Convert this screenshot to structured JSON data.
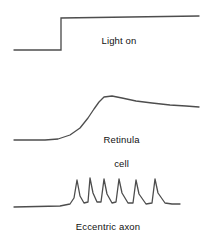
{
  "figure": {
    "background_color": "#ffffff",
    "trace_color": "#4d4d4d",
    "label_color": "#111111",
    "width": 204,
    "height": 242
  },
  "labels": {
    "light_on": "Light on",
    "retinula_line1": "Retinula",
    "retinula_line2": "cell",
    "eccentric_axon": "Eccentric axon"
  },
  "chart_data": {
    "type": "line",
    "xlabel": "",
    "ylabel": "",
    "grid": false,
    "legend": "none",
    "xlim": [
      0,
      204
    ],
    "ylim": [
      242,
      0
    ],
    "annotations": [
      {
        "text": "Light on",
        "x": 135,
        "y": 41
      },
      {
        "text": "Retinula cell",
        "x": 131,
        "y": 134
      },
      {
        "text": "Eccentric axon",
        "x": 133,
        "y": 227
      }
    ],
    "series": [
      {
        "name": "Light on",
        "description": "Square step stimulus marker: flat low baseline, sharp step up at stimulus onset, then sustained high level.",
        "stroke": "#4d4d4d",
        "baseline_y": 50,
        "plateau_y": 18,
        "onset_x": 61,
        "points": [
          [
            14,
            50
          ],
          [
            61,
            50
          ],
          [
            61,
            18
          ],
          [
            199,
            16
          ]
        ]
      },
      {
        "name": "Retinula cell",
        "description": "Graded receptor potential: slow depolarizing sigmoid rise with transient peak overshoot, then slow decay to a sustained plateau.",
        "stroke": "#4d4d4d",
        "baseline_y": 140,
        "peak_y": 97,
        "peak_x": 104,
        "plateau_y": 107,
        "points": [
          [
            14,
            140
          ],
          [
            45,
            140
          ],
          [
            58,
            139
          ],
          [
            70,
            135
          ],
          [
            80,
            128
          ],
          [
            88,
            118
          ],
          [
            94,
            109
          ],
          [
            99,
            102
          ],
          [
            104,
            97
          ],
          [
            112,
            96
          ],
          [
            122,
            98
          ],
          [
            136,
            101
          ],
          [
            152,
            103
          ],
          [
            170,
            105
          ],
          [
            186,
            106
          ],
          [
            199,
            107
          ]
        ]
      },
      {
        "name": "Eccentric axon",
        "description": "Train of six action potentials riding on a slow depolarization; spike frequency highest at onset and declining with adaptation.",
        "stroke": "#4d4d4d",
        "baseline_y": 207,
        "spike_peak_y": 178,
        "spike_count": 6,
        "spike_x_positions": [
          77,
          90,
          104,
          119,
          136,
          155
        ],
        "spike_peak_y_values": [
          180,
          178,
          179,
          179,
          180,
          179
        ],
        "spike_trough_y_values": [
          204,
          203,
          203,
          203,
          204,
          202
        ],
        "points": [
          [
            14,
            207
          ],
          [
            60,
            206
          ],
          [
            70,
            204
          ],
          [
            74,
            198
          ],
          [
            77,
            180
          ],
          [
            80,
            196
          ],
          [
            84,
            203
          ],
          [
            88,
            202
          ],
          [
            90,
            178
          ],
          [
            93,
            193
          ],
          [
            97,
            202
          ],
          [
            101,
            202
          ],
          [
            104,
            179
          ],
          [
            107,
            194
          ],
          [
            112,
            203
          ],
          [
            116,
            202
          ],
          [
            119,
            179
          ],
          [
            122,
            193
          ],
          [
            128,
            203
          ],
          [
            133,
            203
          ],
          [
            136,
            180
          ],
          [
            139,
            194
          ],
          [
            146,
            204
          ],
          [
            152,
            203
          ],
          [
            155,
            179
          ],
          [
            158,
            193
          ],
          [
            165,
            203
          ],
          [
            172,
            204
          ],
          [
            180,
            204
          ]
        ]
      }
    ]
  }
}
